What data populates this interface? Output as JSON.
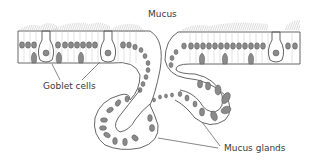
{
  "diagram": {
    "labels": {
      "mucus": "Mucus",
      "goblet_cells": "Goblet cells",
      "mucus_glands": "Mucus glands"
    },
    "colors": {
      "outline": "#555555",
      "nucleus_fill": "#8a8a8a",
      "mucus_hatch": "#9a9a9a",
      "cell_wall": "#c4c4c4",
      "text": "#3a3a3a"
    }
  }
}
